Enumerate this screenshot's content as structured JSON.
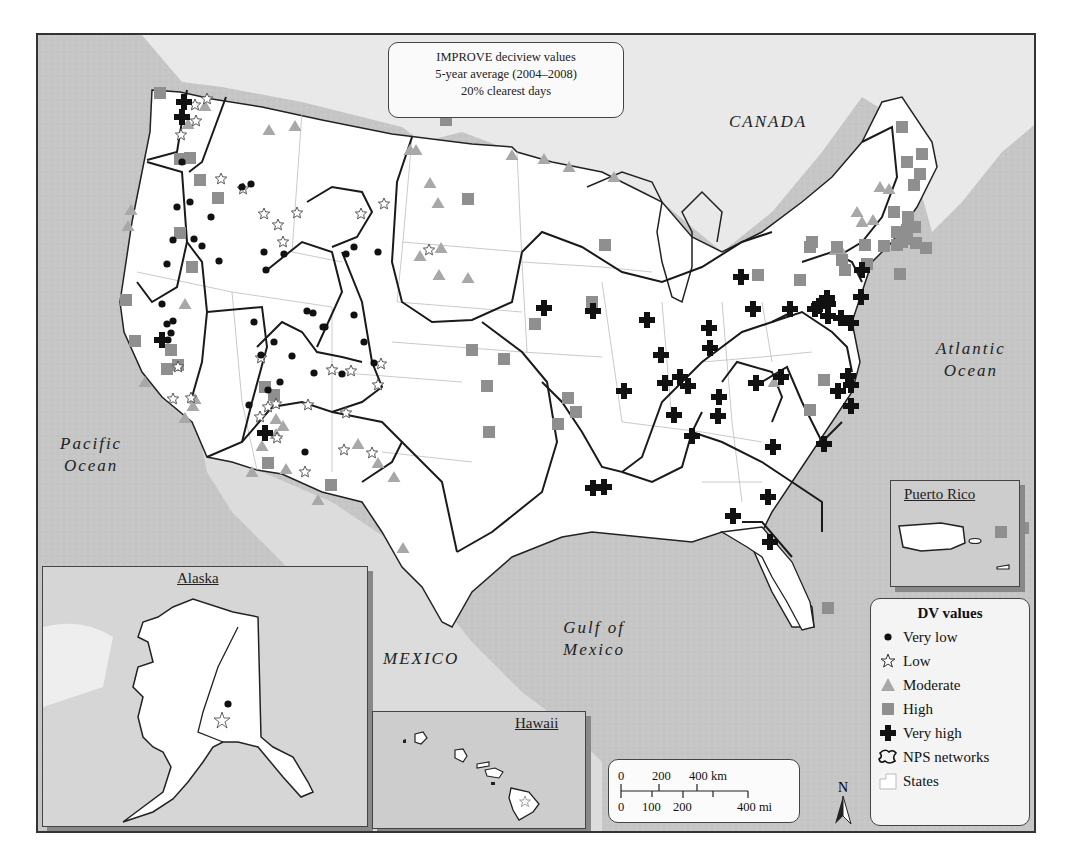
{
  "title": {
    "line1": "IMPROVE deciview values",
    "line2": "5-year average (2004–2008)",
    "line3": "20% clearest days"
  },
  "labels": {
    "canada": "CANADA",
    "pacific_1": "Pacific",
    "pacific_2": "Ocean",
    "atlantic_1": "Atlantic",
    "atlantic_2": "Ocean",
    "gulf_1": "Gulf of",
    "gulf_2": "Mexico",
    "mexico": "MEXICO"
  },
  "insets": {
    "alaska": "Alaska",
    "hawaii": "Hawaii",
    "puerto_rico": "Puerto Rico"
  },
  "legend": {
    "title": "DV values",
    "items": [
      {
        "symbol": "very-low",
        "label": "Very low"
      },
      {
        "symbol": "low",
        "label": "Low"
      },
      {
        "symbol": "moderate",
        "label": "Moderate"
      },
      {
        "symbol": "high",
        "label": "High"
      },
      {
        "symbol": "very-high",
        "label": "Very high"
      },
      {
        "symbol": "nps",
        "label": "NPS networks"
      },
      {
        "symbol": "states",
        "label": "States"
      }
    ]
  },
  "scale": {
    "km_ticks": [
      "0",
      "200",
      "400 km"
    ],
    "mi_ticks": [
      "0",
      "100",
      "200",
      "400 mi"
    ]
  },
  "north": "N",
  "colors": {
    "very_low": "#111111",
    "low": "#ffffff",
    "moderate": "#a8a8a8",
    "high": "#8f8f8f",
    "very_high": "#111111",
    "ocean": "#c9c9c9",
    "land": "#ffffff"
  },
  "markers": {
    "very_low": [
      [
        180,
        160
      ],
      [
        175,
        205
      ],
      [
        188,
        200
      ],
      [
        209,
        215
      ],
      [
        240,
        185
      ],
      [
        249,
        182
      ],
      [
        200,
        244
      ],
      [
        192,
        237
      ],
      [
        171,
        238
      ],
      [
        165,
        262
      ],
      [
        160,
        302
      ],
      [
        166,
        338
      ],
      [
        171,
        319
      ],
      [
        165,
        322
      ],
      [
        169,
        331
      ],
      [
        264,
        268
      ],
      [
        217,
        259
      ],
      [
        282,
        252
      ],
      [
        262,
        250
      ],
      [
        305,
        309
      ],
      [
        311,
        311
      ],
      [
        323,
        325
      ],
      [
        321,
        325
      ],
      [
        344,
        252
      ],
      [
        352,
        245
      ],
      [
        376,
        250
      ],
      [
        352,
        313
      ],
      [
        362,
        340
      ],
      [
        372,
        361
      ],
      [
        340,
        372
      ],
      [
        312,
        371
      ],
      [
        303,
        450
      ],
      [
        290,
        354
      ],
      [
        252,
        320
      ],
      [
        272,
        340
      ],
      [
        259,
        353
      ],
      [
        266,
        388
      ],
      [
        278,
        380
      ],
      [
        247,
        403
      ]
    ],
    "low": [
      [
        205,
        97
      ],
      [
        193,
        103
      ],
      [
        194,
        119
      ],
      [
        179,
        133
      ],
      [
        219,
        177
      ],
      [
        241,
        187
      ],
      [
        262,
        212
      ],
      [
        276,
        223
      ],
      [
        295,
        211
      ],
      [
        281,
        240
      ],
      [
        359,
        212
      ],
      [
        382,
        202
      ],
      [
        427,
        248
      ],
      [
        259,
        356
      ],
      [
        379,
        362
      ],
      [
        330,
        368
      ],
      [
        349,
        369
      ],
      [
        376,
        383
      ],
      [
        176,
        365
      ],
      [
        171,
        397
      ],
      [
        189,
        396
      ],
      [
        266,
        405
      ],
      [
        274,
        402
      ],
      [
        258,
        415
      ],
      [
        306,
        403
      ],
      [
        344,
        411
      ],
      [
        370,
        451
      ],
      [
        303,
        470
      ],
      [
        275,
        436
      ],
      [
        342,
        448
      ]
    ],
    "moderate": [
      [
        186,
        122
      ],
      [
        203,
        104
      ],
      [
        267,
        128
      ],
      [
        293,
        124
      ],
      [
        129,
        208
      ],
      [
        126,
        224
      ],
      [
        408,
        148
      ],
      [
        414,
        148
      ],
      [
        428,
        181
      ],
      [
        436,
        201
      ],
      [
        418,
        254
      ],
      [
        439,
        246
      ],
      [
        437,
        273
      ],
      [
        466,
        276
      ],
      [
        510,
        153
      ],
      [
        542,
        157
      ],
      [
        567,
        165
      ],
      [
        612,
        175
      ],
      [
        183,
        302
      ],
      [
        143,
        380
      ],
      [
        193,
        397
      ],
      [
        191,
        404
      ],
      [
        183,
        416
      ],
      [
        274,
        417
      ],
      [
        281,
        424
      ],
      [
        274,
        432
      ],
      [
        260,
        444
      ],
      [
        250,
        470
      ],
      [
        284,
        467
      ],
      [
        376,
        461
      ],
      [
        392,
        475
      ],
      [
        356,
        442
      ],
      [
        316,
        498
      ],
      [
        401,
        546
      ],
      [
        772,
        380
      ],
      [
        878,
        185
      ],
      [
        887,
        187
      ],
      [
        855,
        210
      ],
      [
        871,
        218
      ],
      [
        860,
        220
      ],
      [
        840,
        250
      ],
      [
        833,
        248
      ]
    ],
    "high": [
      [
        158,
        91
      ],
      [
        188,
        156
      ],
      [
        178,
        157
      ],
      [
        198,
        178
      ],
      [
        216,
        196
      ],
      [
        444,
        118
      ],
      [
        178,
        231
      ],
      [
        190,
        265
      ],
      [
        263,
        385
      ],
      [
        272,
        393
      ],
      [
        266,
        461
      ],
      [
        329,
        483
      ],
      [
        124,
        298
      ],
      [
        133,
        339
      ],
      [
        169,
        348
      ],
      [
        165,
        367
      ],
      [
        176,
        363
      ],
      [
        466,
        197
      ],
      [
        470,
        348
      ],
      [
        485,
        384
      ],
      [
        487,
        430
      ],
      [
        502,
        357
      ],
      [
        590,
        300
      ],
      [
        603,
        243
      ],
      [
        533,
        322
      ],
      [
        574,
        410
      ],
      [
        566,
        396
      ],
      [
        556,
        422
      ],
      [
        822,
        378
      ],
      [
        756,
        273
      ],
      [
        798,
        278
      ],
      [
        810,
        240
      ],
      [
        808,
        245
      ],
      [
        835,
        245
      ],
      [
        840,
        258
      ],
      [
        843,
        268
      ],
      [
        808,
        408
      ],
      [
        900,
        125
      ],
      [
        920,
        152
      ],
      [
        905,
        160
      ],
      [
        918,
        172
      ],
      [
        912,
        183
      ],
      [
        892,
        210
      ],
      [
        863,
        243
      ],
      [
        898,
        272
      ],
      [
        903,
        235
      ],
      [
        1021,
        526
      ],
      [
        826,
        606
      ],
      [
        906,
        215
      ],
      [
        895,
        230
      ],
      [
        882,
        244
      ],
      [
        865,
        262
      ],
      [
        913,
        225
      ],
      [
        895,
        243
      ],
      [
        914,
        241
      ],
      [
        905,
        232
      ],
      [
        904,
        237
      ],
      [
        924,
        246
      ],
      [
        906,
        222
      ],
      [
        905,
        228
      ],
      [
        900,
        240
      ]
    ],
    "very_high": [
      [
        182,
        100
      ],
      [
        180,
        115
      ],
      [
        160,
        338
      ],
      [
        263,
        431
      ],
      [
        542,
        306
      ],
      [
        591,
        309
      ],
      [
        645,
        318
      ],
      [
        739,
        275
      ],
      [
        751,
        307
      ],
      [
        825,
        296
      ],
      [
        788,
        307
      ],
      [
        817,
        304
      ],
      [
        813,
        307
      ],
      [
        860,
        268
      ],
      [
        859,
        295
      ],
      [
        707,
        326
      ],
      [
        754,
        381
      ],
      [
        717,
        395
      ],
      [
        708,
        346
      ],
      [
        659,
        353
      ],
      [
        663,
        381
      ],
      [
        686,
        384
      ],
      [
        678,
        375
      ],
      [
        622,
        389
      ],
      [
        779,
        375
      ],
      [
        716,
        414
      ],
      [
        771,
        445
      ],
      [
        690,
        434
      ],
      [
        672,
        413
      ],
      [
        849,
        404
      ],
      [
        822,
        442
      ],
      [
        602,
        485
      ],
      [
        591,
        486
      ],
      [
        766,
        495
      ],
      [
        731,
        514
      ],
      [
        768,
        540
      ],
      [
        836,
        389
      ],
      [
        849,
        383
      ],
      [
        846,
        374
      ],
      [
        826,
        302
      ],
      [
        839,
        316
      ],
      [
        849,
        321
      ],
      [
        826,
        314
      ]
    ]
  }
}
